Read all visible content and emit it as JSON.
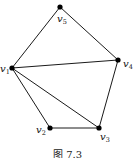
{
  "figure": {
    "caption": "图 7.3",
    "nodes": [
      {
        "id": "v1",
        "base": "v",
        "sub": "1",
        "x": 12,
        "y": 68,
        "lx": 0,
        "ly": 72
      },
      {
        "id": "v2",
        "base": "v",
        "sub": "2",
        "x": 50,
        "y": 128,
        "lx": 36,
        "ly": 133
      },
      {
        "id": "v3",
        "base": "v",
        "sub": "3",
        "x": 99,
        "y": 128,
        "lx": 100,
        "ly": 140
      },
      {
        "id": "v4",
        "base": "v",
        "sub": "4",
        "x": 118,
        "y": 60,
        "lx": 123,
        "ly": 67
      },
      {
        "id": "v5",
        "base": "v",
        "sub": "5",
        "x": 60,
        "y": 7,
        "lx": 57,
        "ly": 22
      }
    ],
    "edges": [
      [
        "v5",
        "v1"
      ],
      [
        "v5",
        "v4"
      ],
      [
        "v1",
        "v4"
      ],
      [
        "v1",
        "v2"
      ],
      [
        "v1",
        "v3"
      ],
      [
        "v2",
        "v3"
      ],
      [
        "v4",
        "v3"
      ]
    ],
    "colors": {
      "edge": "#1a1a1a",
      "node": "#000000",
      "background": "#ffffff"
    }
  }
}
